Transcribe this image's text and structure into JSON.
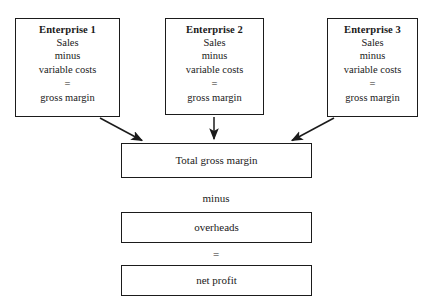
{
  "diagram": {
    "colors": {
      "background": "#ffffff",
      "stroke": "#1b1b1b",
      "text": "#1a1a1a"
    },
    "enterprises": [
      {
        "title": "Enterprise 1",
        "line1": "Sales",
        "line2": "minus",
        "line3": "variable costs",
        "equals": "=",
        "result": "gross margin"
      },
      {
        "title": "Enterprise 2",
        "line1": "Sales",
        "line2": "minus",
        "line3": "variable costs",
        "equals": "=",
        "result": "gross margin"
      },
      {
        "title": "Enterprise 3",
        "line1": "Sales",
        "line2": "minus",
        "line3": "variable costs",
        "equals": "=",
        "result": "gross margin"
      }
    ],
    "total_box": {
      "label": "Total gross margin"
    },
    "minus_connector": {
      "label": "minus"
    },
    "overheads_box": {
      "label": "overheads"
    },
    "equals_connector": {
      "label": "="
    },
    "net_profit_box": {
      "label": "net profit"
    },
    "arrows": [
      {
        "name": "arrow-enterprise-1-to-total",
        "from": "Enterprise 1",
        "to": "Total gross margin",
        "style": "diagonal-down-right"
      },
      {
        "name": "arrow-enterprise-2-to-total",
        "from": "Enterprise 2",
        "to": "Total gross margin",
        "style": "vertical-down"
      },
      {
        "name": "arrow-enterprise-3-to-total",
        "from": "Enterprise 3",
        "to": "Total gross margin",
        "style": "diagonal-down-left"
      }
    ]
  }
}
